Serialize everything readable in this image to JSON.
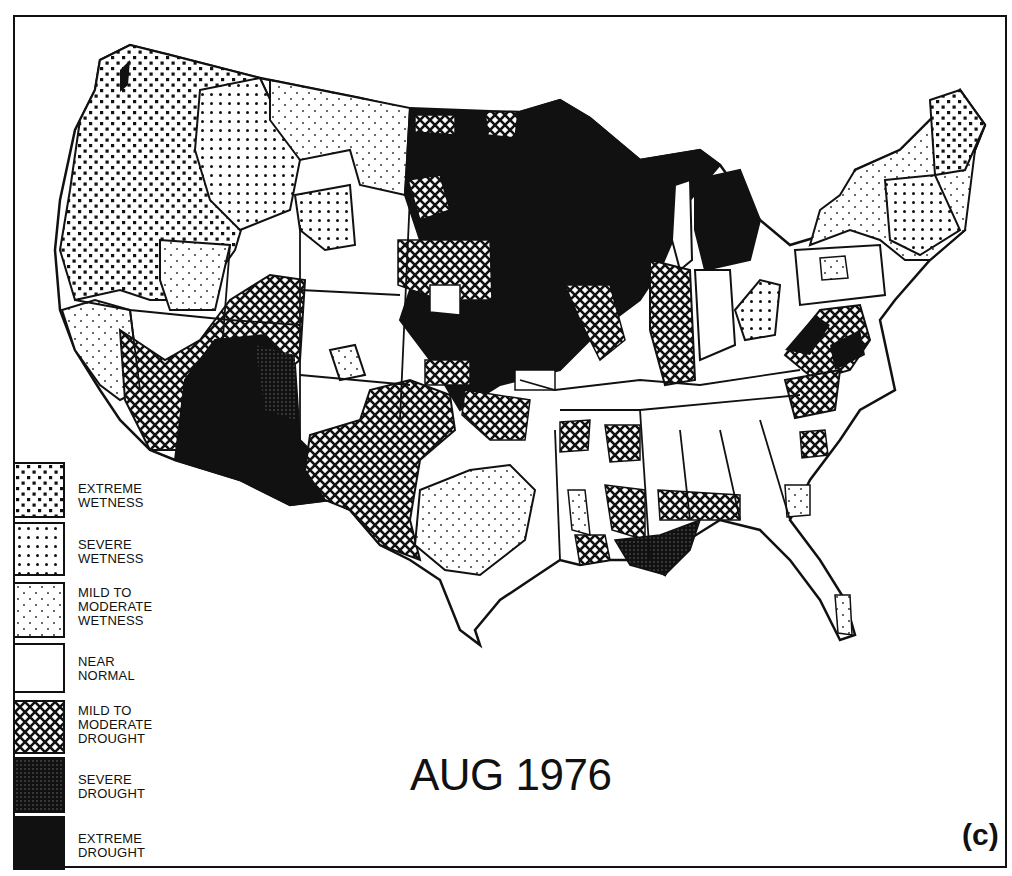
{
  "map": {
    "title": "AUG 1976",
    "panel_label": "(c)",
    "subject": "Palmer drought severity, contiguous United States climate divisions",
    "legend": {
      "items": [
        {
          "key": "extreme-wetness",
          "label": "EXTREME\nWETNESS",
          "pattern": "dense-squares"
        },
        {
          "key": "severe-wetness",
          "label": "SEVERE\nWETNESS",
          "pattern": "medium-dots"
        },
        {
          "key": "mild-moderate-wetness",
          "label": "MILD TO\nMODERATE\nWETNESS",
          "pattern": "sparse-dots"
        },
        {
          "key": "near-normal",
          "label": "NEAR\nNORMAL",
          "pattern": "blank"
        },
        {
          "key": "mild-moderate-drought",
          "label": "MILD TO\nMODERATE\nDROUGHT",
          "pattern": "crosshatch"
        },
        {
          "key": "severe-drought",
          "label": "SEVERE\nDROUGHT",
          "pattern": "dark-stipple"
        },
        {
          "key": "extreme-drought",
          "label": "EXTREME\nDROUGHT",
          "pattern": "solid-black"
        }
      ]
    },
    "regions_summary": [
      {
        "area": "Pacific Northwest & Northern Rockies",
        "category": "extreme-wetness"
      },
      {
        "area": "Montana plains, Nevada, Northeast",
        "category": "mild-moderate-wetness"
      },
      {
        "area": "Upper Midwest (MN, WI, IA, MI, Dakotas east)",
        "category": "extreme-drought"
      },
      {
        "area": "Arizona & SW New Mexico",
        "category": "extreme-drought"
      },
      {
        "area": "Texas Panhandle/West Texas, Kansas, Illinois, Indiana",
        "category": "mild-moderate-drought"
      },
      {
        "area": "Central Texas",
        "category": "mild-moderate-wetness"
      },
      {
        "area": "Louisiana coast",
        "category": "severe-drought"
      },
      {
        "area": "Southeast, Wyoming, Colorado, Utah",
        "category": "near-normal"
      }
    ]
  }
}
